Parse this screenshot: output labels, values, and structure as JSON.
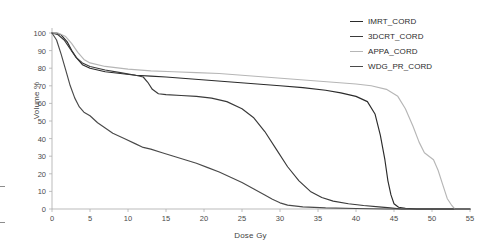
{
  "chart_data": {
    "type": "line",
    "title": "",
    "xlabel": "Dose Gy",
    "ylabel": "Volume %",
    "xlim": [
      0,
      55
    ],
    "ylim": [
      0,
      100
    ],
    "xticks": [
      0,
      5,
      10,
      15,
      20,
      25,
      30,
      35,
      40,
      45,
      50,
      55
    ],
    "yticks": [
      0,
      10,
      20,
      30,
      40,
      50,
      60,
      70,
      80,
      90,
      100
    ],
    "grid": false,
    "legend_position": "top-right",
    "series": [
      {
        "name": "IMRT_CORD",
        "color": "#2b2b2b",
        "x": [
          0,
          0.6,
          1.2,
          2,
          2.6,
          3.2,
          4,
          5,
          7,
          9,
          11,
          13,
          15,
          18,
          21,
          24,
          27,
          30,
          33,
          36,
          38,
          40,
          41.5,
          42.5,
          43.2,
          43.8,
          44.2,
          44.6,
          45,
          45.6,
          46.5,
          48,
          55
        ],
        "y": [
          100,
          100,
          99,
          95,
          90,
          86,
          82,
          80,
          78,
          77,
          76,
          75.5,
          75,
          74,
          73,
          72,
          71,
          70,
          69,
          67.5,
          66,
          64,
          61,
          54,
          42,
          28,
          16,
          8,
          3,
          1,
          0.4,
          0,
          0
        ]
      },
      {
        "name": "3DCRT_CORD",
        "color": "#3a3a3a",
        "x": [
          0,
          0.8,
          1.6,
          2.4,
          3.2,
          4,
          5,
          7,
          9,
          11,
          12,
          12.6,
          13.2,
          14,
          15,
          17,
          19,
          21,
          23,
          25,
          26.5,
          28,
          29.5,
          31,
          32.5,
          34,
          35.5,
          37,
          39,
          41,
          43,
          44.5,
          46,
          55
        ],
        "y": [
          100,
          99,
          96,
          91,
          86,
          83,
          81,
          79,
          77.5,
          76,
          75,
          72,
          68,
          65.5,
          65,
          64.5,
          64,
          63,
          61,
          57,
          52,
          44,
          34,
          24,
          16,
          10,
          6.5,
          4.5,
          3,
          2,
          1.2,
          0.6,
          0,
          0
        ]
      },
      {
        "name": "APPA_CORD",
        "color": "#b6b6b6",
        "x": [
          0,
          0.8,
          1.8,
          2.6,
          3.4,
          4.2,
          5,
          7,
          10,
          13,
          16,
          19,
          22,
          25,
          28,
          31,
          34,
          37,
          40,
          42,
          44,
          45.5,
          46.5,
          47.5,
          48.3,
          49,
          49.6,
          50.2,
          50.8,
          51.4,
          52,
          52.6,
          53,
          55
        ],
        "y": [
          100,
          100,
          98,
          94,
          89,
          85,
          83,
          81,
          79.5,
          78.5,
          78,
          77.5,
          77,
          76,
          75,
          74,
          73,
          72,
          71,
          70,
          68,
          64,
          57,
          47,
          38,
          32,
          30,
          28,
          22,
          14,
          6,
          2,
          0,
          0
        ]
      },
      {
        "name": "WDG_PR_CORD",
        "color": "#4a4a4a",
        "x": [
          0,
          0.6,
          1.2,
          1.8,
          2.4,
          3,
          3.6,
          4.2,
          5,
          6,
          7,
          8,
          9.5,
          11,
          12,
          13,
          14.5,
          16,
          17.5,
          19,
          20.5,
          22,
          23.5,
          25,
          26.5,
          28,
          29,
          30,
          31,
          33,
          36,
          40,
          44,
          55
        ],
        "y": [
          100,
          96,
          88,
          79,
          70,
          63,
          58,
          55,
          53,
          49,
          46,
          43,
          40,
          37,
          35,
          34,
          32,
          30,
          28,
          26,
          23.5,
          21,
          18,
          15,
          11.5,
          8,
          5.5,
          3.5,
          2.2,
          1.2,
          0.6,
          0.3,
          0,
          0
        ]
      }
    ]
  },
  "legend": {
    "items": [
      {
        "label": "IMRT_CORD"
      },
      {
        "label": "3DCRT_CORD"
      },
      {
        "label": "APPA_CORD"
      },
      {
        "label": "WDG_PR_CORD"
      }
    ]
  }
}
